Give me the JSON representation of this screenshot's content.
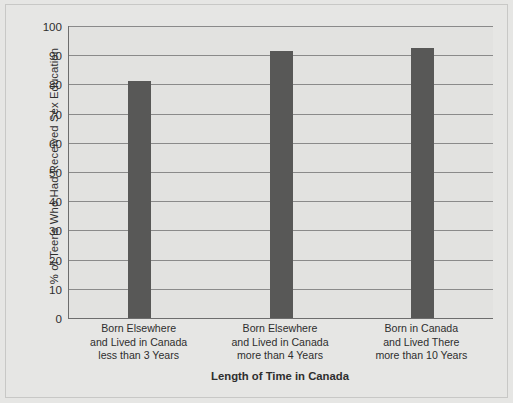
{
  "chart_data": {
    "type": "bar",
    "title": "",
    "subtitle": "",
    "xlabel": "Length of Time in Canada",
    "ylabel": "% of Teens Who Had Received Sex Education",
    "categories": [
      "Born Elsewhere\nand Lived in Canada\nless than 3 Years",
      "Born Elsewhere\nand Lived in Canada\nmore than 4 Years",
      "Born in Canada\nand Lived There\nmore than 10 Years"
    ],
    "category_lines": [
      [
        "Born Elsewhere",
        "and Lived in Canada",
        "less than 3 Years"
      ],
      [
        "Born Elsewhere",
        "and Lived in Canada",
        "more than 4 Years"
      ],
      [
        "Born in Canada",
        "and Lived There",
        "more than 10 Years"
      ]
    ],
    "values": [
      81,
      91.5,
      92.5
    ],
    "ylim": [
      0,
      100
    ],
    "yticks": [
      0,
      10,
      20,
      30,
      40,
      50,
      60,
      70,
      80,
      90,
      100
    ],
    "ytick_labels": [
      "0",
      "10",
      "20",
      "30",
      "40",
      "50",
      "60",
      "70",
      "80",
      "90",
      "100"
    ],
    "grid": true,
    "legend": null,
    "bar_color": "#585857",
    "plot_background": "#e2e2e0",
    "figure_background": "#e6e6e4",
    "gridline_color": "#8a8a8a",
    "axis_color": "#6d6d6d",
    "text_color": "#2e2e2e"
  }
}
